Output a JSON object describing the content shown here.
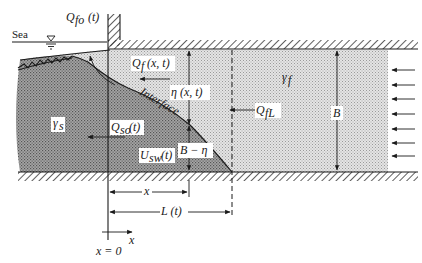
{
  "figure": {
    "labels": {
      "sea": "Sea",
      "q_fo": "Q",
      "q_fo_sub": "fo",
      "q_fo_arg": "(t)",
      "q_f": "Q",
      "q_f_sub": "f",
      "q_f_arg": "(x, t)",
      "eta": "η (x, t)",
      "interface": "Interface",
      "q_fl": "Q",
      "q_fl_sub": "fL",
      "gamma_f": "γ",
      "gamma_f_sub": "f",
      "gamma_s": "γ",
      "gamma_s_sub": "s",
      "q_so": "Q",
      "q_so_sub": "so",
      "q_so_arg": "(t)",
      "u_sw": "U",
      "u_sw_sub": "sw",
      "u_sw_arg": "(t)",
      "b_minus_eta": "B − η",
      "b": "B",
      "x_dim": "x",
      "l_dim": "L (t)",
      "x_axis": "x",
      "origin": "x = 0"
    },
    "regions": [
      {
        "name": "saltwater-wedge",
        "density_label": "γs",
        "shade": "#8a8a8a"
      },
      {
        "name": "freshwater-layer",
        "density_label": "γf",
        "shade": "#cfcfcf"
      }
    ],
    "inflow_arrows_count": 7,
    "colors": {
      "ink": "#1a1a1a",
      "salt_shade": "#8a8a8a",
      "fresh_shade": "#d2d2d2",
      "background": "#ffffff"
    }
  }
}
